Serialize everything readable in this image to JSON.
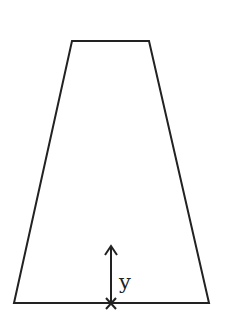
{
  "diagram": {
    "shape": "trapezoid",
    "stroke_color": "#222222",
    "background": "#ffffff",
    "trapezoid_points": "72,41 149,41 209,303 14,303",
    "arrow": {
      "x": 111,
      "y_start": 303,
      "y_end": 246
    },
    "origin_marker": "x",
    "axis_label": "y"
  }
}
